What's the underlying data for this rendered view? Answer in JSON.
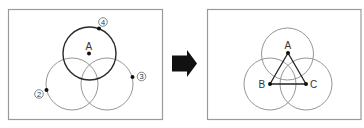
{
  "left_panel": {
    "label_A": "A",
    "marker_2": "2",
    "marker_3": "3",
    "marker_4": "4",
    "circles": [
      {
        "role": "top",
        "cx": 89,
        "cy": 53,
        "r": 26,
        "style": "bold"
      },
      {
        "role": "left",
        "cx": 72,
        "cy": 84,
        "r": 26,
        "style": "thin"
      },
      {
        "role": "right",
        "cx": 107,
        "cy": 84,
        "r": 26,
        "style": "thin"
      }
    ],
    "points": {
      "A": [
        89,
        53
      ],
      "p2": [
        46,
        90
      ],
      "p3": [
        132,
        77
      ],
      "p4": [
        99,
        28
      ]
    }
  },
  "arrow": {
    "direction": "right",
    "color": "#111111"
  },
  "right_panel": {
    "label_A": "A",
    "label_B": "B",
    "label_C": "C",
    "circles": [
      {
        "role": "top",
        "cx": 288,
        "cy": 53,
        "r": 26
      },
      {
        "role": "left",
        "cx": 270,
        "cy": 84,
        "r": 26
      },
      {
        "role": "right",
        "cx": 306,
        "cy": 84,
        "r": 26
      }
    ],
    "points": {
      "A": [
        288,
        53
      ],
      "B": [
        270,
        84
      ],
      "C": [
        306,
        84
      ]
    },
    "triangle": "A-B-C"
  }
}
